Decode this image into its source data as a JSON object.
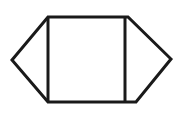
{
  "figure": {
    "type": "geometric-line-drawing",
    "canvas": {
      "width": 183,
      "height": 113
    },
    "colors": {
      "background": "#ffffff",
      "fill": "#ffffff",
      "stroke": "#1a1a1a"
    },
    "stroke_width": 3,
    "polygon": {
      "name": "hexagon",
      "sides": 6,
      "points": "12,60 48,17 128,17 171,59 136,102 48,102",
      "vertices": [
        {
          "name": "left-apex",
          "x": 12,
          "y": 60
        },
        {
          "name": "top-left",
          "x": 48,
          "y": 17
        },
        {
          "name": "top-right",
          "x": 128,
          "y": 17
        },
        {
          "name": "right-apex",
          "x": 171,
          "y": 59
        },
        {
          "name": "bottom-right",
          "x": 136,
          "y": 102
        },
        {
          "name": "bottom-left",
          "x": 48,
          "y": 102
        }
      ]
    },
    "chords": [
      {
        "name": "left-chord",
        "x1": 48,
        "y1": 17,
        "x2": 48,
        "y2": 102
      },
      {
        "name": "right-chord",
        "x1": 125,
        "y1": 17,
        "x2": 125,
        "y2": 102
      }
    ],
    "regions": [
      {
        "name": "left-triangle",
        "label": ""
      },
      {
        "name": "middle-rectangle",
        "label": ""
      },
      {
        "name": "right-region",
        "label": ""
      }
    ]
  }
}
